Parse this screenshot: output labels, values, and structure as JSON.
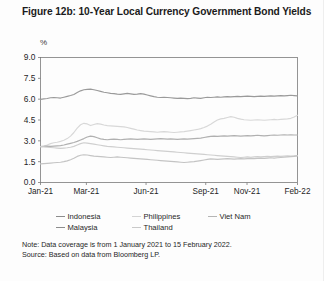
{
  "title": "Figure 12b: 10-Year Local Currency Government Bond Yields",
  "axis_unit": "%",
  "note": "Note: Data coverage is from 1 January 2021 to 15 February 2022.",
  "source": "Source: Based on data from Bloomberg LP.",
  "legend": {
    "row1": [
      {
        "label": "Indonesia",
        "color": "#8c8c8c"
      },
      {
        "label": "Philippines",
        "color": "#d4d4d4"
      },
      {
        "label": "Viet Nam",
        "color": "#b5b5b5"
      }
    ],
    "row2": [
      {
        "label": "Malaysia",
        "color": "#8c8c8c"
      },
      {
        "label": "Thailand",
        "color": "#c9c9c9"
      }
    ]
  },
  "chart_data": {
    "type": "line",
    "title": "Figure 12b: 10-Year Local Currency Government Bond Yields",
    "xlabel": "",
    "ylabel": "%",
    "ylim": [
      0.0,
      9.0
    ],
    "yticks": [
      "0.0",
      "1.5",
      "3.0",
      "4.5",
      "6.0",
      "7.5",
      "9.0"
    ],
    "ytick_values": [
      0.0,
      1.5,
      3.0,
      4.5,
      6.0,
      7.5,
      9.0
    ],
    "xticks": [
      "Jan-21",
      "Mar-21",
      "Jun-21",
      "Sep-21",
      "Nov-21",
      "Feb-22"
    ],
    "xtick_positions": [
      0,
      0.1786,
      0.4107,
      0.6429,
      0.8036,
      1.0
    ],
    "grid": false,
    "legend_position": "bottom",
    "x_range": [
      "1 January 2021",
      "15 February 2022"
    ],
    "series": [
      {
        "name": "Indonesia",
        "color": "#9a9a9a",
        "values": [
          5.98,
          6.02,
          6.05,
          6.1,
          6.12,
          6.1,
          6.08,
          6.14,
          6.2,
          6.26,
          6.34,
          6.48,
          6.6,
          6.68,
          6.7,
          6.72,
          6.68,
          6.62,
          6.56,
          6.5,
          6.46,
          6.42,
          6.4,
          6.36,
          6.34,
          6.38,
          6.42,
          6.38,
          6.34,
          6.36,
          6.4,
          6.36,
          6.3,
          6.24,
          6.18,
          6.14,
          6.12,
          6.14,
          6.12,
          6.1,
          6.08,
          6.06,
          6.08,
          6.06,
          6.04,
          6.06,
          6.1,
          6.08,
          6.06,
          6.1,
          6.14,
          6.12,
          6.14,
          6.16,
          6.14,
          6.16,
          6.18,
          6.16,
          6.18,
          6.2,
          6.18,
          6.2,
          6.22,
          6.2,
          6.18,
          6.2,
          6.22,
          6.2,
          6.22,
          6.24,
          6.22,
          6.24,
          6.26,
          6.24,
          6.26,
          6.28,
          6.26,
          6.24
        ]
      },
      {
        "name": "Philippines",
        "color": "#d8d8d8",
        "values": [
          2.58,
          2.62,
          2.7,
          2.8,
          2.86,
          2.9,
          2.96,
          3.04,
          3.16,
          3.34,
          3.6,
          3.92,
          4.16,
          4.26,
          4.22,
          4.1,
          4.18,
          4.24,
          4.2,
          4.14,
          4.1,
          4.08,
          4.06,
          4.04,
          4.02,
          4.0,
          3.96,
          3.9,
          3.84,
          3.78,
          3.74,
          3.7,
          3.68,
          3.66,
          3.64,
          3.62,
          3.64,
          3.66,
          3.64,
          3.62,
          3.6,
          3.62,
          3.64,
          3.66,
          3.7,
          3.74,
          3.78,
          3.82,
          3.88,
          3.96,
          4.06,
          4.2,
          4.36,
          4.5,
          4.58,
          4.62,
          4.68,
          4.74,
          4.7,
          4.62,
          4.56,
          4.52,
          4.5,
          4.48,
          4.5,
          4.52,
          4.5,
          4.48,
          4.5,
          4.52,
          4.54,
          4.52,
          4.54,
          4.56,
          4.58,
          4.62,
          4.72,
          4.84
        ]
      },
      {
        "name": "Viet Nam",
        "color": "#b0b0b0",
        "values": [
          2.58,
          2.6,
          2.62,
          2.6,
          2.62,
          2.64,
          2.66,
          2.7,
          2.76,
          2.82,
          2.88,
          2.96,
          3.06,
          3.16,
          3.28,
          3.34,
          3.3,
          3.22,
          3.14,
          3.1,
          3.08,
          3.1,
          3.12,
          3.1,
          3.08,
          3.1,
          3.12,
          3.14,
          3.12,
          3.1,
          3.12,
          3.14,
          3.12,
          3.1,
          3.12,
          3.14,
          3.16,
          3.14,
          3.12,
          3.14,
          3.12,
          3.1,
          3.12,
          3.14,
          3.12,
          3.14,
          3.16,
          3.18,
          3.2,
          3.24,
          3.28,
          3.32,
          3.34,
          3.32,
          3.34,
          3.36,
          3.34,
          3.36,
          3.38,
          3.36,
          3.34,
          3.36,
          3.38,
          3.36,
          3.38,
          3.4,
          3.38,
          3.36,
          3.38,
          3.4,
          3.42,
          3.4,
          3.42,
          3.44,
          3.42,
          3.44,
          3.42,
          3.42
        ]
      },
      {
        "name": "Malaysia",
        "color": "#cfcfcf",
        "values": [
          2.58,
          2.56,
          2.54,
          2.52,
          2.5,
          2.48,
          2.46,
          2.48,
          2.5,
          2.54,
          2.6,
          2.7,
          2.8,
          2.86,
          2.84,
          2.8,
          2.76,
          2.72,
          2.68,
          2.64,
          2.6,
          2.58,
          2.56,
          2.54,
          2.52,
          2.5,
          2.48,
          2.46,
          2.44,
          2.42,
          2.4,
          2.38,
          2.36,
          2.34,
          2.32,
          2.3,
          2.28,
          2.26,
          2.24,
          2.22,
          2.2,
          2.18,
          2.16,
          2.14,
          2.12,
          2.1,
          2.08,
          2.06,
          2.04,
          2.02,
          2.0,
          1.98,
          1.96,
          1.94,
          1.92,
          1.9,
          1.88,
          1.86,
          1.84,
          1.82,
          1.8,
          1.82,
          1.84,
          1.82,
          1.84,
          1.86,
          1.84,
          1.86,
          1.88,
          1.86,
          1.88,
          1.9,
          1.88,
          1.9,
          1.92,
          1.9,
          1.92,
          1.94
        ]
      },
      {
        "name": "Thailand",
        "color": "#c4c4c4",
        "values": [
          1.34,
          1.36,
          1.38,
          1.4,
          1.42,
          1.44,
          1.46,
          1.5,
          1.56,
          1.64,
          1.74,
          1.88,
          1.96,
          2.0,
          1.98,
          1.94,
          1.9,
          1.88,
          1.86,
          1.84,
          1.82,
          1.8,
          1.82,
          1.84,
          1.82,
          1.8,
          1.78,
          1.76,
          1.74,
          1.72,
          1.7,
          1.68,
          1.66,
          1.64,
          1.62,
          1.6,
          1.58,
          1.56,
          1.54,
          1.52,
          1.5,
          1.48,
          1.46,
          1.44,
          1.46,
          1.48,
          1.5,
          1.54,
          1.58,
          1.62,
          1.66,
          1.7,
          1.68,
          1.66,
          1.68,
          1.7,
          1.72,
          1.7,
          1.68,
          1.7,
          1.72,
          1.7,
          1.72,
          1.74,
          1.72,
          1.74,
          1.76,
          1.74,
          1.76,
          1.78,
          1.76,
          1.78,
          1.8,
          1.82,
          1.84,
          1.86,
          1.88,
          1.92
        ]
      }
    ]
  }
}
